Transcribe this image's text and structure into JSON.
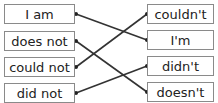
{
  "left_items": [
    {
      "label": "I am"
    },
    {
      "label": "does not"
    },
    {
      "label": "could not"
    },
    {
      "label": "did not"
    }
  ],
  "right_items": [
    {
      "label": "couldn't"
    },
    {
      "label": "I'm"
    },
    {
      "label": "didn't"
    },
    {
      "label": "doesn't"
    }
  ],
  "connections": [
    {
      "from": "I am",
      "to": "I'm"
    },
    {
      "from": "does not",
      "to": "doesn't"
    },
    {
      "from": "could not",
      "to": "couldn't"
    },
    {
      "from": "did not",
      "to": "didn't"
    }
  ],
  "colors": {
    "line": "#333333",
    "border": "#8a8a8a"
  }
}
